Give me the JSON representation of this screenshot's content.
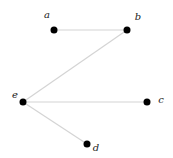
{
  "diagram": {
    "type": "graph",
    "edge_color": "#d4d4d4",
    "node_color": "#000000",
    "nodes": [
      {
        "id": "a",
        "label": "a",
        "x": 54,
        "y": 30,
        "lx": 47,
        "ly": 18
      },
      {
        "id": "b",
        "label": "b",
        "x": 127,
        "y": 30,
        "lx": 138,
        "ly": 20
      },
      {
        "id": "c",
        "label": "c",
        "x": 147,
        "y": 102,
        "lx": 161,
        "ly": 103
      },
      {
        "id": "d",
        "label": "d",
        "x": 87,
        "y": 144,
        "lx": 96,
        "ly": 151
      },
      {
        "id": "e",
        "label": "e",
        "x": 23,
        "y": 102,
        "lx": 15,
        "ly": 98
      }
    ],
    "edges": [
      {
        "from": "a",
        "to": "b"
      },
      {
        "from": "b",
        "to": "e"
      },
      {
        "from": "e",
        "to": "c"
      },
      {
        "from": "e",
        "to": "d"
      }
    ]
  }
}
